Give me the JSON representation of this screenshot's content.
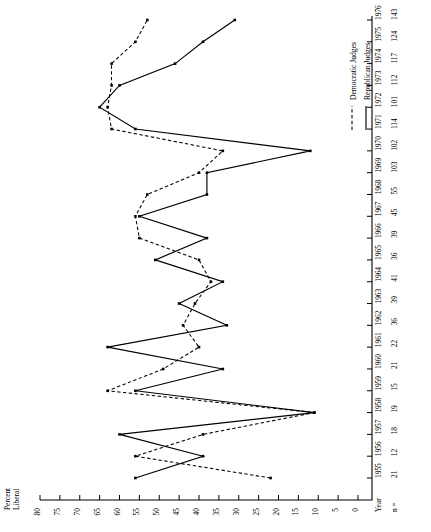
{
  "chart_data": {
    "type": "line",
    "title": "",
    "orientation": "rotated-90",
    "xlabel": "Percent Liberal",
    "ylabel": "Year",
    "xlabel_line1": "Percent",
    "xlabel_line2": "Liberal",
    "year_axis_label": "Year",
    "n_axis_label": "n =",
    "percent_ticks": [
      80,
      75,
      70,
      65,
      60,
      55,
      50,
      45,
      40,
      35,
      30,
      25,
      20,
      15,
      10,
      5,
      0
    ],
    "xlim": [
      0,
      80
    ],
    "grid": false,
    "legend_position": "top-right",
    "categories": [
      1955,
      1956,
      1957,
      1958,
      1959,
      1960,
      1961,
      1962,
      1963,
      1964,
      1965,
      1966,
      1967,
      1968,
      1969,
      1970,
      1971,
      1972,
      1973,
      1974,
      1975,
      1976
    ],
    "n_values": [
      21,
      12,
      18,
      19,
      15,
      21,
      22,
      36,
      39,
      41,
      36,
      39,
      45,
      55,
      103,
      102,
      114,
      101,
      112,
      117,
      124,
      143
    ],
    "series": [
      {
        "name": "Democratic Judges",
        "style": "dashed",
        "color": "#000000",
        "values": [
          22,
          56,
          39,
          11,
          63,
          49,
          40,
          44,
          41,
          37,
          40,
          55,
          56,
          53,
          40,
          34,
          62,
          63,
          62,
          62,
          56,
          53
        ]
      },
      {
        "name": "Republican Judges",
        "style": "solid",
        "color": "#000000",
        "values": [
          56,
          39,
          60,
          11,
          56,
          34,
          63,
          33,
          45,
          34,
          51,
          38,
          55,
          38,
          38,
          12,
          56,
          65,
          60,
          46,
          39,
          31
        ]
      }
    ]
  },
  "legend": {
    "items": [
      {
        "label": "Democratic Judges",
        "style": "dashed"
      },
      {
        "label": "Republican Judges",
        "style": "solid"
      }
    ]
  }
}
